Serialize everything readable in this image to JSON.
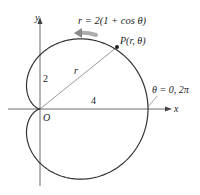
{
  "diagram": {
    "equation": "r = 2(1 + cos θ)",
    "point_label": "P(r, θ)",
    "radius_label": "r",
    "origin_label": "O",
    "x_axis_label": "x",
    "y_axis_label": "y",
    "y_intercept_label": "2",
    "x_intercept_label": "4",
    "angle_label": "θ = 0, 2π",
    "colors": {
      "curve": "#333333",
      "axis": "#444444",
      "arrow": "#8a8a8a"
    }
  }
}
